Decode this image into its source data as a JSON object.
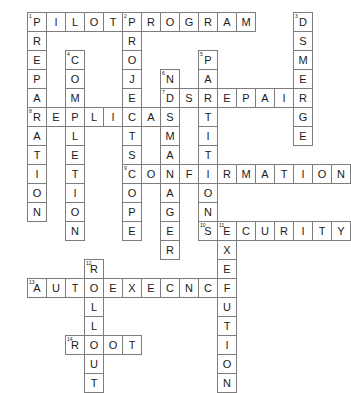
{
  "puzzle": {
    "type": "crossword-grid",
    "title": "",
    "origin_x": 27,
    "origin_y": 12,
    "cell_size": 19,
    "cell_border_color": "#7d7d7d",
    "cell_fill_color": "#ffffff",
    "letter_color": "#1a1a1a",
    "background_color": "#ffffff",
    "cells": [
      {
        "r": 0,
        "c": 0,
        "letter": "P",
        "num": "1"
      },
      {
        "r": 0,
        "c": 1,
        "letter": "I",
        "num": ""
      },
      {
        "r": 0,
        "c": 2,
        "letter": "L",
        "num": ""
      },
      {
        "r": 0,
        "c": 3,
        "letter": "O",
        "num": ""
      },
      {
        "r": 0,
        "c": 4,
        "letter": "T",
        "num": ""
      },
      {
        "r": 0,
        "c": 5,
        "letter": "P",
        "num": "2"
      },
      {
        "r": 0,
        "c": 6,
        "letter": "R",
        "num": ""
      },
      {
        "r": 0,
        "c": 7,
        "letter": "O",
        "num": ""
      },
      {
        "r": 0,
        "c": 8,
        "letter": "G",
        "num": ""
      },
      {
        "r": 0,
        "c": 9,
        "letter": "R",
        "num": ""
      },
      {
        "r": 0,
        "c": 10,
        "letter": "A",
        "num": ""
      },
      {
        "r": 0,
        "c": 11,
        "letter": "M",
        "num": ""
      },
      {
        "r": 0,
        "c": 14,
        "letter": "D",
        "num": "3"
      },
      {
        "r": 1,
        "c": 0,
        "letter": "R",
        "num": ""
      },
      {
        "r": 1,
        "c": 5,
        "letter": "R",
        "num": ""
      },
      {
        "r": 1,
        "c": 14,
        "letter": "S",
        "num": ""
      },
      {
        "r": 2,
        "c": 0,
        "letter": "E",
        "num": ""
      },
      {
        "r": 2,
        "c": 2,
        "letter": "C",
        "num": "4"
      },
      {
        "r": 2,
        "c": 5,
        "letter": "O",
        "num": ""
      },
      {
        "r": 2,
        "c": 9,
        "letter": "P",
        "num": "5"
      },
      {
        "r": 2,
        "c": 14,
        "letter": "M",
        "num": ""
      },
      {
        "r": 3,
        "c": 0,
        "letter": "P",
        "num": ""
      },
      {
        "r": 3,
        "c": 2,
        "letter": "O",
        "num": ""
      },
      {
        "r": 3,
        "c": 5,
        "letter": "J",
        "num": ""
      },
      {
        "r": 3,
        "c": 7,
        "letter": "N",
        "num": "6"
      },
      {
        "r": 3,
        "c": 9,
        "letter": "A",
        "num": ""
      },
      {
        "r": 3,
        "c": 14,
        "letter": "E",
        "num": ""
      },
      {
        "r": 4,
        "c": 0,
        "letter": "A",
        "num": ""
      },
      {
        "r": 4,
        "c": 2,
        "letter": "M",
        "num": ""
      },
      {
        "r": 4,
        "c": 5,
        "letter": "E",
        "num": ""
      },
      {
        "r": 4,
        "c": 7,
        "letter": "D",
        "num": "7"
      },
      {
        "r": 4,
        "c": 8,
        "letter": "S",
        "num": ""
      },
      {
        "r": 4,
        "c": 9,
        "letter": "R",
        "num": ""
      },
      {
        "r": 4,
        "c": 10,
        "letter": "E",
        "num": ""
      },
      {
        "r": 4,
        "c": 11,
        "letter": "P",
        "num": ""
      },
      {
        "r": 4,
        "c": 12,
        "letter": "A",
        "num": ""
      },
      {
        "r": 4,
        "c": 13,
        "letter": "I",
        "num": ""
      },
      {
        "r": 4,
        "c": 14,
        "letter": "R",
        "num": ""
      },
      {
        "r": 5,
        "c": 0,
        "letter": "R",
        "num": "8"
      },
      {
        "r": 5,
        "c": 1,
        "letter": "E",
        "num": ""
      },
      {
        "r": 5,
        "c": 2,
        "letter": "P",
        "num": ""
      },
      {
        "r": 5,
        "c": 3,
        "letter": "L",
        "num": ""
      },
      {
        "r": 5,
        "c": 4,
        "letter": "I",
        "num": ""
      },
      {
        "r": 5,
        "c": 5,
        "letter": "C",
        "num": ""
      },
      {
        "r": 5,
        "c": 6,
        "letter": "A",
        "num": ""
      },
      {
        "r": 5,
        "c": 7,
        "letter": "S",
        "num": ""
      },
      {
        "r": 5,
        "c": 9,
        "letter": "T",
        "num": ""
      },
      {
        "r": 5,
        "c": 14,
        "letter": "G",
        "num": ""
      },
      {
        "r": 6,
        "c": 0,
        "letter": "A",
        "num": ""
      },
      {
        "r": 6,
        "c": 2,
        "letter": "L",
        "num": ""
      },
      {
        "r": 6,
        "c": 5,
        "letter": "T",
        "num": ""
      },
      {
        "r": 6,
        "c": 7,
        "letter": "M",
        "num": ""
      },
      {
        "r": 6,
        "c": 9,
        "letter": "I",
        "num": ""
      },
      {
        "r": 6,
        "c": 14,
        "letter": "E",
        "num": ""
      },
      {
        "r": 7,
        "c": 0,
        "letter": "T",
        "num": ""
      },
      {
        "r": 7,
        "c": 2,
        "letter": "E",
        "num": ""
      },
      {
        "r": 7,
        "c": 5,
        "letter": "S",
        "num": ""
      },
      {
        "r": 7,
        "c": 7,
        "letter": "A",
        "num": ""
      },
      {
        "r": 7,
        "c": 9,
        "letter": "T",
        "num": ""
      },
      {
        "r": 8,
        "c": 0,
        "letter": "I",
        "num": ""
      },
      {
        "r": 8,
        "c": 2,
        "letter": "T",
        "num": ""
      },
      {
        "r": 8,
        "c": 5,
        "letter": "C",
        "num": "9"
      },
      {
        "r": 8,
        "c": 6,
        "letter": "O",
        "num": ""
      },
      {
        "r": 8,
        "c": 7,
        "letter": "N",
        "num": ""
      },
      {
        "r": 8,
        "c": 8,
        "letter": "F",
        "num": ""
      },
      {
        "r": 8,
        "c": 9,
        "letter": "I",
        "num": ""
      },
      {
        "r": 8,
        "c": 10,
        "letter": "R",
        "num": ""
      },
      {
        "r": 8,
        "c": 11,
        "letter": "M",
        "num": ""
      },
      {
        "r": 8,
        "c": 12,
        "letter": "A",
        "num": ""
      },
      {
        "r": 8,
        "c": 13,
        "letter": "T",
        "num": ""
      },
      {
        "r": 8,
        "c": 14,
        "letter": "I",
        "num": ""
      },
      {
        "r": 8,
        "c": 15,
        "letter": "O",
        "num": ""
      },
      {
        "r": 8,
        "c": 16,
        "letter": "N",
        "num": ""
      },
      {
        "r": 9,
        "c": 0,
        "letter": "O",
        "num": ""
      },
      {
        "r": 9,
        "c": 2,
        "letter": "I",
        "num": ""
      },
      {
        "r": 9,
        "c": 5,
        "letter": "O",
        "num": ""
      },
      {
        "r": 9,
        "c": 7,
        "letter": "A",
        "num": ""
      },
      {
        "r": 9,
        "c": 9,
        "letter": "O",
        "num": ""
      },
      {
        "r": 10,
        "c": 0,
        "letter": "N",
        "num": ""
      },
      {
        "r": 10,
        "c": 2,
        "letter": "O",
        "num": ""
      },
      {
        "r": 10,
        "c": 5,
        "letter": "P",
        "num": ""
      },
      {
        "r": 10,
        "c": 7,
        "letter": "G",
        "num": ""
      },
      {
        "r": 10,
        "c": 9,
        "letter": "N",
        "num": ""
      },
      {
        "r": 11,
        "c": 2,
        "letter": "N",
        "num": ""
      },
      {
        "r": 11,
        "c": 5,
        "letter": "E",
        "num": ""
      },
      {
        "r": 11,
        "c": 7,
        "letter": "E",
        "num": ""
      },
      {
        "r": 11,
        "c": 9,
        "letter": "S",
        "num": "10"
      },
      {
        "r": 11,
        "c": 10,
        "letter": "E",
        "num": "11"
      },
      {
        "r": 11,
        "c": 11,
        "letter": "C",
        "num": ""
      },
      {
        "r": 11,
        "c": 12,
        "letter": "U",
        "num": ""
      },
      {
        "r": 11,
        "c": 13,
        "letter": "R",
        "num": ""
      },
      {
        "r": 11,
        "c": 14,
        "letter": "I",
        "num": ""
      },
      {
        "r": 11,
        "c": 15,
        "letter": "T",
        "num": ""
      },
      {
        "r": 11,
        "c": 16,
        "letter": "Y",
        "num": ""
      },
      {
        "r": 12,
        "c": 7,
        "letter": "R",
        "num": ""
      },
      {
        "r": 12,
        "c": 10,
        "letter": "X",
        "num": ""
      },
      {
        "r": 13,
        "c": 3,
        "letter": "R",
        "num": "12"
      },
      {
        "r": 13,
        "c": 10,
        "letter": "E",
        "num": ""
      },
      {
        "r": 14,
        "c": 0,
        "letter": "A",
        "num": "13"
      },
      {
        "r": 14,
        "c": 1,
        "letter": "U",
        "num": ""
      },
      {
        "r": 14,
        "c": 2,
        "letter": "T",
        "num": ""
      },
      {
        "r": 14,
        "c": 3,
        "letter": "O",
        "num": ""
      },
      {
        "r": 14,
        "c": 4,
        "letter": "E",
        "num": ""
      },
      {
        "r": 14,
        "c": 5,
        "letter": "X",
        "num": ""
      },
      {
        "r": 14,
        "c": 6,
        "letter": "E",
        "num": ""
      },
      {
        "r": 14,
        "c": 7,
        "letter": "C",
        "num": ""
      },
      {
        "r": 14,
        "c": 8,
        "letter": "N",
        "num": ""
      },
      {
        "r": 14,
        "c": 9,
        "letter": "C",
        "num": ""
      },
      {
        "r": 14,
        "c": 10,
        "letter": "F",
        "num": ""
      },
      {
        "r": 15,
        "c": 3,
        "letter": "L",
        "num": ""
      },
      {
        "r": 15,
        "c": 10,
        "letter": "U",
        "num": ""
      },
      {
        "r": 16,
        "c": 3,
        "letter": "L",
        "num": ""
      },
      {
        "r": 16,
        "c": 10,
        "letter": "T",
        "num": ""
      },
      {
        "r": 17,
        "c": 2,
        "letter": "R",
        "num": "14"
      },
      {
        "r": 17,
        "c": 3,
        "letter": "O",
        "num": ""
      },
      {
        "r": 17,
        "c": 4,
        "letter": "O",
        "num": ""
      },
      {
        "r": 17,
        "c": 5,
        "letter": "T",
        "num": ""
      },
      {
        "r": 17,
        "c": 10,
        "letter": "I",
        "num": ""
      },
      {
        "r": 18,
        "c": 3,
        "letter": "U",
        "num": ""
      },
      {
        "r": 18,
        "c": 10,
        "letter": "O",
        "num": ""
      },
      {
        "r": 19,
        "c": 3,
        "letter": "T",
        "num": ""
      },
      {
        "r": 19,
        "c": 10,
        "letter": "N",
        "num": ""
      }
    ],
    "entries": {
      "across": [
        {
          "num": "1",
          "answer": "PILOT"
        },
        {
          "num": "2",
          "answer": "PROGRAM"
        },
        {
          "num": "7",
          "answer": "DSREPAIR"
        },
        {
          "num": "8",
          "answer": "REPLICAS"
        },
        {
          "num": "9",
          "answer": "CONFIRMATION"
        },
        {
          "num": "11",
          "answer": "SECURITY"
        },
        {
          "num": "13",
          "answer": "AUTOEXECNCF"
        },
        {
          "num": "14",
          "answer": "ROOT"
        }
      ],
      "down": [
        {
          "num": "1",
          "answer": "PREPARATION"
        },
        {
          "num": "2",
          "answer": "PROJECTSCOPE"
        },
        {
          "num": "3",
          "answer": "DSMERGE"
        },
        {
          "num": "4",
          "answer": "COMPLETION"
        },
        {
          "num": "5",
          "answer": "PARTITIONS"
        },
        {
          "num": "6",
          "answer": "NDSMANAGER"
        },
        {
          "num": "10",
          "answer": "SECURITY"
        },
        {
          "num": "11",
          "answer": "EXECUTION"
        },
        {
          "num": "12",
          "answer": "ROLLOUT"
        }
      ]
    }
  }
}
